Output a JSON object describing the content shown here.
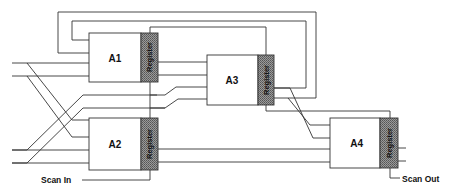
{
  "diagram": {
    "type": "scan-chain block diagram",
    "blocks": [
      {
        "id": "A1",
        "label": "A1",
        "register_label": "Register"
      },
      {
        "id": "A2",
        "label": "A2",
        "register_label": "Register"
      },
      {
        "id": "A3",
        "label": "A3",
        "register_label": "Register"
      },
      {
        "id": "A4",
        "label": "A4",
        "register_label": "Register"
      }
    ],
    "io": {
      "scan_in": "Scan In",
      "scan_out": "Scan Out"
    },
    "colors": {
      "line": "#333333",
      "register_fill": "#8a8a8a",
      "background": "#ffffff"
    }
  }
}
